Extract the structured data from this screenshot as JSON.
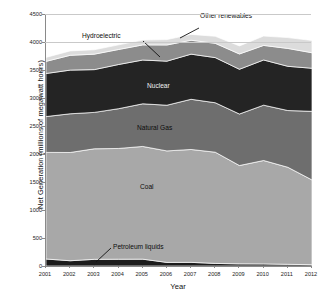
{
  "chart_data": {
    "type": "area",
    "title": "",
    "xlabel": "Year",
    "ylabel": "Net Generation (millions of megawatt hours)",
    "stacked": true,
    "grid": false,
    "legend_position": "inline-annotations",
    "ylim": [
      0,
      4500
    ],
    "ytick_values": [
      0,
      500,
      1000,
      1500,
      2000,
      2500,
      3000,
      3500,
      4000,
      4500
    ],
    "ytick_labels": [
      "0",
      "500",
      "1000",
      "1500",
      "2000",
      "2500",
      "3000",
      "3500",
      "4000",
      "4500"
    ],
    "x": [
      2001,
      2002,
      2003,
      2004,
      2005,
      2006,
      2007,
      2008,
      2009,
      2010,
      2011,
      2012
    ],
    "xtick_labels": [
      "2001",
      "2002",
      "2003",
      "2004",
      "2005",
      "2006",
      "2007",
      "2008",
      "2009",
      "2010",
      "2011",
      "2012"
    ],
    "series": [
      {
        "name": "Petroleum liquids",
        "color": "#1c1c1c",
        "values": [
          125,
          94,
          119,
          121,
          122,
          64,
          65,
          46,
          38,
          37,
          30,
          23
        ]
      },
      {
        "name": "Coal",
        "color": "#a8a8a8",
        "values": [
          1904,
          1933,
          1974,
          1978,
          2013,
          1991,
          2016,
          1986,
          1756,
          1847,
          1733,
          1514
        ]
      },
      {
        "name": "Natural Gas",
        "color": "#6e6e6e",
        "values": [
          639,
          691,
          650,
          710,
          761,
          816,
          896,
          883,
          920,
          988,
          1013,
          1225
        ]
      },
      {
        "name": "Nuclear",
        "color": "#242424",
        "values": [
          769,
          780,
          764,
          789,
          782,
          787,
          806,
          806,
          799,
          807,
          790,
          769
        ]
      },
      {
        "name": "Hydroelectric",
        "color": "#8c8c8c",
        "values": [
          217,
          264,
          276,
          268,
          270,
          289,
          248,
          255,
          273,
          260,
          319,
          277
        ]
      },
      {
        "name": "Other renewables",
        "color": "#dcdcdc",
        "values": [
          71,
          79,
          79,
          83,
          87,
          96,
          105,
          126,
          144,
          167,
          194,
          219
        ]
      }
    ],
    "annotations": [
      {
        "label": "Other renewables",
        "series": "Other renewables"
      },
      {
        "label": "Hydroelectric",
        "series": "Hydroelectric"
      },
      {
        "label": "Nuclear",
        "series": "Nuclear"
      },
      {
        "label": "Natural Gas",
        "series": "Natural Gas"
      },
      {
        "label": "Coal",
        "series": "Coal"
      },
      {
        "label": "Petroleum liquids",
        "series": "Petroleum liquids"
      }
    ]
  },
  "axes": {
    "ylabel": "Net Generation (millions of megawatt hours)",
    "xlabel": "Year"
  },
  "labels": {
    "other_renewables": "Other renewables",
    "hydroelectric": "Hydroelectric",
    "nuclear": "Nuclear",
    "natural_gas": "Natural Gas",
    "coal": "Coal",
    "petroleum_liquids": "Petroleum liquids"
  },
  "colors": {
    "petroleum_liquids": "#1c1c1c",
    "coal": "#a8a8a8",
    "natural_gas": "#6e6e6e",
    "nuclear": "#242424",
    "hydroelectric": "#8c8c8c",
    "other_renewables": "#dcdcdc",
    "axis": "#8a8a8a",
    "text": "#1a1a1a"
  }
}
